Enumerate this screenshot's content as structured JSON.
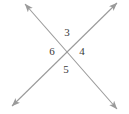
{
  "figure": {
    "background_color": "#ffffff",
    "line_color": "#9a9a9a",
    "label_color": "#3a3a3a",
    "intersection": {
      "x": 67,
      "y": 54
    },
    "lines": [
      {
        "name": "line-upper-left-to-lower-right",
        "x1": 25,
        "y1": 4,
        "x2": 117,
        "y2": 109,
        "arrow_start": true,
        "arrow_end": true
      },
      {
        "name": "line-lower-left-to-upper-right",
        "x1": 12,
        "y1": 106,
        "x2": 117,
        "y2": 3,
        "arrow_start": true,
        "arrow_end": true
      }
    ],
    "labels": [
      {
        "name": "angle-label-top",
        "text": "3",
        "position": "top",
        "x": 66,
        "y": 33
      },
      {
        "name": "angle-label-left",
        "text": "6",
        "position": "left",
        "x": 52,
        "y": 52
      },
      {
        "name": "angle-label-right",
        "text": "4",
        "position": "right",
        "x": 81,
        "y": 52
      },
      {
        "name": "angle-label-bottom",
        "text": "5",
        "position": "bottom",
        "x": 66,
        "y": 70
      }
    ]
  }
}
